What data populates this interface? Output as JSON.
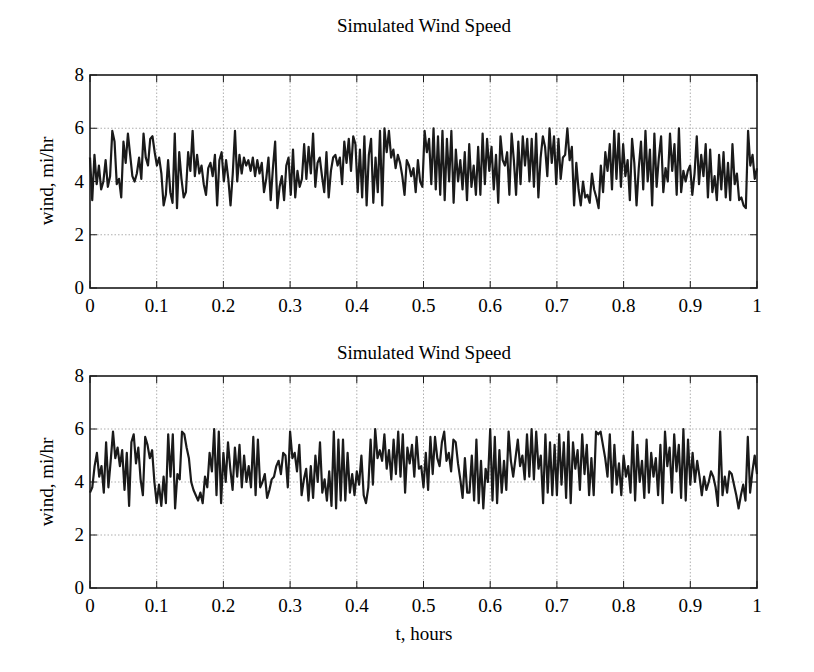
{
  "figure": {
    "width": 814,
    "height": 672,
    "line_color": "#1a1a1a",
    "grid_color": "#9a9a9a"
  },
  "chart_data": [
    {
      "type": "line",
      "title": "Simulated Wind Speed",
      "xlabel": "",
      "ylabel": "wind, mi/hr",
      "xlim": [
        0,
        1
      ],
      "ylim": [
        0,
        8
      ],
      "xticks": [
        0,
        0.1,
        0.2,
        0.3,
        0.4,
        0.5,
        0.6,
        0.7,
        0.8,
        0.9,
        1
      ],
      "xtick_labels": [
        "0",
        "0.1",
        "0.2",
        "0.3",
        "0.4",
        "0.5",
        "0.6",
        "0.7",
        "0.8",
        "0.9",
        "1"
      ],
      "yticks": [
        0,
        2,
        4,
        6,
        8
      ],
      "ytick_labels": [
        "0",
        "2",
        "4",
        "6",
        "8"
      ],
      "grid": true,
      "legend": null,
      "series": [
        {
          "name": "wind",
          "x_start": 0,
          "x_end": 1,
          "values": [
            4.9,
            3.3,
            5.0,
            3.9,
            4.6,
            3.7,
            4.0,
            4.8,
            3.8,
            4.2,
            5.9,
            5.5,
            3.9,
            4.1,
            3.4,
            5.5,
            4.7,
            5.8,
            5.0,
            4.2,
            4.0,
            4.3,
            4.9,
            4.1,
            5.8,
            4.9,
            4.6,
            5.6,
            5.7,
            5.1,
            4.6,
            4.9,
            4.3,
            3.1,
            3.5,
            4.8,
            3.6,
            3.2,
            5.8,
            3.0,
            5.1,
            4.1,
            3.4,
            3.6,
            5.1,
            4.4,
            5.9,
            4.2,
            5.0,
            4.3,
            4.6,
            3.9,
            3.5,
            4.5,
            4.7,
            4.2,
            5.0,
            3.1,
            4.8,
            5.1,
            4.0,
            4.8,
            4.1,
            3.1,
            4.3,
            5.9,
            4.0,
            5.0,
            4.3,
            4.9,
            4.6,
            4.8,
            4.4,
            4.9,
            4.2,
            4.8,
            4.3,
            4.7,
            3.6,
            4.1,
            4.9,
            3.3,
            4.5,
            5.5,
            3.0,
            3.8,
            4.2,
            3.3,
            4.6,
            4.9,
            3.5,
            5.2,
            3.4,
            4.4,
            3.8,
            4.1,
            5.4,
            4.1,
            5.3,
            4.3,
            5.8,
            3.8,
            4.7,
            4.9,
            4.2,
            3.6,
            5.1,
            3.4,
            4.4,
            4.9,
            5.0,
            4.6,
            4.9,
            3.9,
            5.5,
            4.7,
            5.6,
            4.4,
            5.7,
            5.4,
            3.6,
            5.2,
            3.4,
            5.7,
            3.1,
            5.0,
            5.6,
            3.2,
            4.9,
            3.6,
            5.9,
            3.1,
            6.0,
            5.1,
            5.9,
            4.9,
            5.2,
            4.5,
            5.0,
            4.7,
            4.2,
            3.5,
            4.8,
            4.6,
            4.2,
            4.5,
            3.6,
            4.8,
            4.0,
            3.8,
            5.9,
            5.1,
            5.6,
            3.9,
            6.0,
            3.7,
            5.7,
            3.5,
            5.9,
            3.3,
            5.6,
            4.0,
            5.9,
            3.2,
            5.2,
            4.0,
            4.8,
            3.7,
            5.1,
            3.3,
            5.4,
            3.8,
            4.6,
            3.5,
            5.3,
            3.5,
            5.8,
            3.9,
            5.6,
            4.4,
            5.3,
            3.7,
            5.0,
            3.2,
            5.7,
            4.8,
            4.6,
            5.1,
            3.5,
            5.8,
            4.8,
            3.5,
            5.5,
            3.9,
            5.7,
            4.6,
            5.6,
            4.0,
            5.6,
            3.8,
            5.8,
            3.4,
            4.9,
            5.7,
            5.3,
            4.2,
            6.0,
            4.7,
            5.7,
            3.9,
            5.6,
            4.1,
            4.9,
            5.0,
            6.0,
            4.8,
            5.3,
            3.1,
            4.7,
            3.7,
            3.1,
            4.0,
            3.4,
            3.5,
            3.2,
            4.3,
            3.7,
            3.4,
            3.0,
            4.6,
            3.6,
            5.1,
            4.4,
            5.4,
            3.7,
            5.9,
            4.1,
            5.8,
            3.8,
            5.4,
            4.2,
            4.8,
            3.3,
            5.6,
            4.7,
            3.1,
            4.5,
            5.5,
            3.7,
            5.9,
            4.0,
            5.2,
            3.1,
            5.8,
            3.8,
            4.9,
            5.7,
            3.6,
            4.5,
            4.0,
            5.8,
            4.4,
            5.4,
            3.5,
            6.0,
            3.6,
            4.4,
            4.0,
            4.4,
            4.6,
            3.5,
            4.3,
            5.7,
            3.9,
            5.0,
            4.2,
            5.4,
            3.4,
            5.2,
            3.6,
            4.2,
            3.3,
            5.0,
            3.7,
            5.1,
            3.4,
            4.7,
            3.3,
            5.4,
            3.9,
            4.3,
            3.3,
            3.4,
            3.1,
            3.0,
            5.9,
            4.6,
            5.0,
            4.1,
            4.5
          ]
        }
      ]
    },
    {
      "type": "line",
      "title": "Simulated Wind Speed",
      "xlabel": "t, hours",
      "ylabel": "wind, mi/hr",
      "xlim": [
        0,
        1
      ],
      "ylim": [
        0,
        8
      ],
      "xticks": [
        0,
        0.1,
        0.2,
        0.3,
        0.4,
        0.5,
        0.6,
        0.7,
        0.8,
        0.9,
        1
      ],
      "xtick_labels": [
        "0",
        "0.1",
        "0.2",
        "0.3",
        "0.4",
        "0.5",
        "0.6",
        "0.7",
        "0.8",
        "0.9",
        "1"
      ],
      "yticks": [
        0,
        2,
        4,
        6,
        8
      ],
      "ytick_labels": [
        "0",
        "2",
        "4",
        "6",
        "8"
      ],
      "grid": true,
      "legend": null,
      "series": [
        {
          "name": "wind",
          "x_start": 0,
          "x_end": 1,
          "values": [
            3.6,
            3.8,
            4.6,
            5.1,
            4.2,
            4.6,
            3.6,
            5.5,
            3.8,
            4.8,
            5.9,
            4.9,
            5.3,
            4.6,
            5.2,
            3.7,
            5.1,
            3.1,
            5.5,
            5.8,
            4.7,
            5.3,
            4.1,
            3.5,
            5.7,
            5.4,
            4.9,
            5.2,
            4.0,
            3.2,
            3.9,
            3.1,
            4.2,
            3.2,
            5.8,
            4.2,
            5.8,
            3.0,
            4.3,
            4.1,
            5.9,
            5.8,
            5.3,
            4.9,
            4.0,
            3.7,
            3.5,
            3.3,
            3.6,
            3.2,
            4.2,
            3.8,
            5.1,
            4.4,
            6.0,
            3.5,
            5.9,
            3.2,
            5.1,
            4.0,
            5.5,
            4.5,
            3.7,
            5.3,
            4.2,
            5.4,
            3.8,
            5.0,
            4.0,
            4.6,
            3.8,
            5.7,
            3.5,
            5.6,
            3.8,
            4.0,
            4.3,
            3.4,
            3.7,
            4.1,
            4.2,
            4.6,
            4.8,
            4.3,
            5.1,
            5.0,
            3.8,
            5.9,
            4.9,
            5.1,
            4.4,
            5.4,
            3.5,
            4.1,
            4.5,
            3.3,
            4.6,
            3.4,
            5.0,
            4.0,
            5.5,
            3.6,
            4.1,
            3.3,
            4.4,
            3.1,
            5.9,
            3.0,
            5.6,
            3.3,
            5.6,
            3.3,
            5.1,
            3.6,
            4.3,
            3.5,
            4.4,
            3.9,
            5.0,
            3.5,
            3.2,
            3.8,
            5.6,
            3.9,
            6.0,
            4.9,
            5.2,
            4.8,
            5.8,
            4.5,
            5.2,
            4.1,
            5.6,
            4.3,
            5.9,
            4.2,
            5.8,
            3.6,
            5.3,
            4.7,
            5.4,
            4.2,
            5.7,
            4.5,
            4.6,
            3.8,
            5.1,
            3.7,
            5.7,
            4.3,
            5.7,
            4.9,
            4.6,
            5.5,
            5.9,
            4.8,
            5.1,
            4.4,
            5.6,
            5.5,
            4.7,
            4.1,
            3.4,
            4.9,
            3.6,
            3.6,
            5.0,
            3.3,
            5.6,
            3.2,
            4.8,
            3.0,
            4.5,
            4.0,
            6.0,
            3.3,
            5.7,
            3.2,
            5.2,
            3.6,
            4.8,
            3.7,
            5.9,
            4.8,
            4.2,
            4.9,
            5.6,
            4.6,
            5.0,
            4.1,
            5.8,
            4.2,
            6.0,
            4.1,
            5.9,
            4.5,
            5.0,
            3.2,
            5.8,
            3.6,
            5.5,
            3.5,
            5.4,
            3.5,
            5.8,
            3.9,
            5.5,
            3.4,
            5.9,
            3.2,
            5.5,
            4.5,
            5.2,
            3.7,
            5.8,
            4.3,
            5.4,
            3.5,
            4.9,
            3.5,
            5.9,
            5.8,
            5.9,
            5.4,
            4.9,
            4.2,
            5.8,
            3.6,
            5.4,
            3.9,
            4.7,
            3.5,
            5.0,
            4.2,
            4.6,
            3.6,
            5.9,
            3.3,
            5.4,
            4.0,
            4.8,
            3.4,
            5.6,
            3.6,
            5.1,
            4.2,
            4.9,
            3.5,
            5.4,
            3.2,
            5.9,
            4.6,
            5.3,
            3.6,
            5.8,
            4.4,
            5.4,
            3.4,
            6.0,
            3.3,
            5.6,
            3.9,
            5.1,
            4.0,
            4.8,
            4.2,
            3.5,
            4.2,
            3.7,
            4.0,
            4.4,
            4.2,
            3.8,
            3.1,
            5.9,
            3.5,
            4.2,
            3.6,
            4.4,
            4.3,
            3.9,
            3.5,
            3.0,
            3.5,
            3.9,
            3.3,
            5.7,
            3.6,
            4.4,
            5.0,
            4.3
          ]
        }
      ]
    }
  ]
}
